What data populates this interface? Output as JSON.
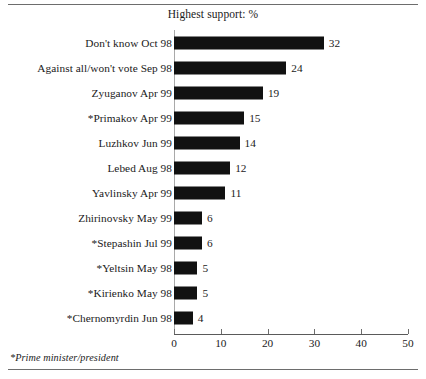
{
  "chart_data": {
    "type": "bar",
    "orientation": "horizontal",
    "title": "Highest support: %",
    "xlabel": "",
    "ylabel": "",
    "xlim": [
      0,
      50
    ],
    "xticks": [
      0,
      10,
      20,
      30,
      40,
      50
    ],
    "grid": false,
    "legend": null,
    "bar_color": "#111111",
    "categories": [
      "Don't know Oct 98",
      "Against all/won't vote Sep 98",
      "Zyuganov Apr 99",
      "*Primakov Apr 99",
      "Luzhkov Jun 99",
      "Lebed Aug 98",
      "Yavlinsky Apr 99",
      "Zhirinovsky May 99",
      "*Stepashin Jul 99",
      "*Yeltsin May 98",
      "*Kirienko May 98",
      "*Chernomyrdin Jun 98"
    ],
    "values": [
      32,
      24,
      19,
      15,
      14,
      12,
      11,
      6,
      6,
      5,
      5,
      4
    ],
    "value_labels": [
      "32",
      "24",
      "19",
      "15",
      "14",
      "12",
      "11",
      "6",
      "6",
      "5",
      "5",
      "4"
    ],
    "annotations": [
      "*Prime minister/president"
    ]
  },
  "footnote": "*Prime minister/president"
}
